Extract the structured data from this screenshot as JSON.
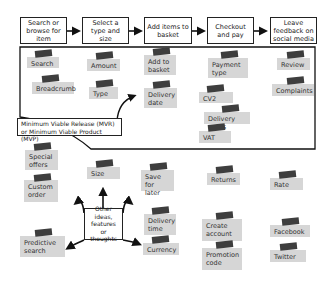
{
  "journey_steps": [
    {
      "label": "Search or browse for item"
    },
    {
      "label": "Select a type and size"
    },
    {
      "label": "Add items to basket"
    },
    {
      "label": "Checkout and pay"
    },
    {
      "label": "Leave feedback on social media"
    }
  ],
  "mvp_label": "Minimum Viable Release (MVR) or Minimum Viable Product (MVP)",
  "center_label": "Other ideas, features or thoughts",
  "mvp_notes": [
    {
      "label": "Search"
    },
    {
      "label": "Breadcrumb"
    },
    {
      "label": "Amount"
    },
    {
      "label": "Type"
    },
    {
      "label": "Add to basket"
    },
    {
      "label": "Delivery date"
    },
    {
      "label": "Payment type"
    },
    {
      "label": "CV2"
    },
    {
      "label": "Delivery notes"
    },
    {
      "label": "VAT"
    },
    {
      "label": "Review"
    },
    {
      "label": "Complaints"
    }
  ],
  "other_notes": [
    {
      "label": "Special offers"
    },
    {
      "label": "Custom order"
    },
    {
      "label": "Predictive search"
    },
    {
      "label": "Size"
    },
    {
      "label": "Save for later"
    },
    {
      "label": "Delivery time"
    },
    {
      "label": "Currency"
    },
    {
      "label": "Returns"
    },
    {
      "label": "Create account"
    },
    {
      "label": "Promotion code"
    },
    {
      "label": "Rate"
    },
    {
      "label": "Facebook"
    },
    {
      "label": "Twitter"
    }
  ],
  "colors": {
    "note": "#d6d6d6",
    "tape": "#3e3e3e",
    "line": "#222222"
  }
}
